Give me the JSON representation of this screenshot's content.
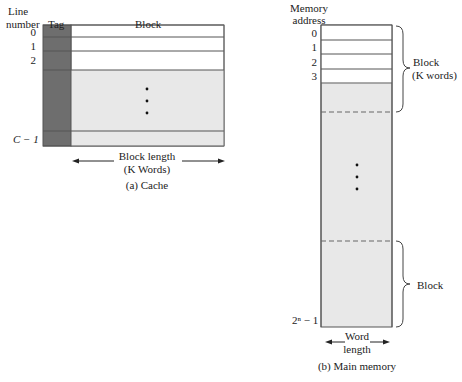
{
  "cache": {
    "header_line": "Line",
    "header_number": "number",
    "header_tag": "Tag",
    "header_block": "Block",
    "line_labels": [
      "0",
      "1",
      "2",
      "C − 1"
    ],
    "block_length_line1": "Block length",
    "block_length_line2": "(K Words)",
    "caption": "(a) Cache"
  },
  "main_memory": {
    "header_line1": "Memory",
    "header_line2": "address",
    "address_labels": [
      "0",
      "1",
      "2",
      "3",
      "2ⁿ − 1"
    ],
    "brace_top_line1": "Block",
    "brace_top_line2": "(K words)",
    "brace_bottom": "Block",
    "word_length_line1": "Word",
    "word_length_line2": "length",
    "caption": "(b) Main memory"
  },
  "colors": {
    "tag_fill": "#6e6e6e",
    "shaded_fill": "#e8e8e8",
    "line": "#555555"
  }
}
